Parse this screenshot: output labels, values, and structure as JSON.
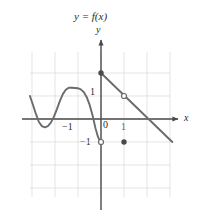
{
  "figure": {
    "title": "y = f(x)",
    "width": 200,
    "height": 217,
    "background": "#ffffff"
  },
  "axes": {
    "x_label": "x",
    "y_label": "y",
    "axis_color": "#4a4a4a",
    "grid_color": "#d8d8d8",
    "origin_px": [
      101,
      119
    ],
    "unit_px": 23,
    "x_axis_y_px": 119,
    "y_axis_x_px": 101,
    "grid_bounds_px": {
      "left": 30,
      "right": 170,
      "top": 52,
      "bottom": 197
    }
  },
  "tick_labels": {
    "y_one": "1",
    "origin": "0",
    "x_one": "1",
    "x_neg_one": "−1",
    "y_neg_one": "−1"
  },
  "chart_data": {
    "type": "line",
    "title": "y = f(x)",
    "xlabel": "x",
    "ylabel": "y",
    "xlim": [
      -3.1,
      3.0
    ],
    "ylim": [
      -2.9,
      3.0
    ],
    "grid": true,
    "legend": "none",
    "series": [
      {
        "name": "oscillating-curve",
        "color": "#6b6b6b",
        "style": "solid",
        "width": 1.9,
        "comment": "wavy curve entering at left, local min near x=-2.45, local max near x=-1.0, falling steeply to open endpoint at (0,-1)",
        "points": [
          [
            -3.09,
            1.0
          ],
          [
            -2.96,
            0.62
          ],
          [
            -2.83,
            0.22
          ],
          [
            -2.7,
            -0.13
          ],
          [
            -2.57,
            -0.31
          ],
          [
            -2.44,
            -0.36
          ],
          [
            -2.31,
            -0.31
          ],
          [
            -2.18,
            -0.16
          ],
          [
            -2.05,
            0.09
          ],
          [
            -1.92,
            0.42
          ],
          [
            -1.79,
            0.78
          ],
          [
            -1.66,
            1.08
          ],
          [
            -1.53,
            1.27
          ],
          [
            -1.4,
            1.36
          ],
          [
            -1.27,
            1.36
          ],
          [
            -1.14,
            1.35
          ],
          [
            -1.01,
            1.34
          ],
          [
            -0.88,
            1.29
          ],
          [
            -0.75,
            1.17
          ],
          [
            -0.62,
            0.95
          ],
          [
            -0.49,
            0.6
          ],
          [
            -0.36,
            0.13
          ],
          [
            -0.24,
            -0.4
          ],
          [
            -0.13,
            -0.78
          ],
          [
            -0.05,
            -0.95
          ],
          [
            0.0,
            -1.0
          ]
        ]
      },
      {
        "name": "descending-line",
        "color": "#6b6b6b",
        "style": "solid",
        "width": 1.9,
        "comment": "straight segment with slope -1 from filled point (0,2) through open hole (1,1) down to (3.1,-1.0)",
        "points": [
          [
            0.0,
            2.0
          ],
          [
            3.1,
            -1.0
          ]
        ]
      }
    ],
    "markers": [
      {
        "name": "filled-point-y-intercept",
        "x": 0,
        "y": 2,
        "type": "filled",
        "color": "#4a4a4a"
      },
      {
        "name": "open-hole-on-line",
        "x": 1,
        "y": 1,
        "type": "open",
        "color": "#6b6b6b"
      },
      {
        "name": "open-endpoint-curve",
        "x": 0,
        "y": -1,
        "type": "open",
        "color": "#6b6b6b"
      },
      {
        "name": "filled-point-lower-right",
        "x": 1,
        "y": -1,
        "type": "filled",
        "color": "#4a4a4a"
      }
    ]
  }
}
